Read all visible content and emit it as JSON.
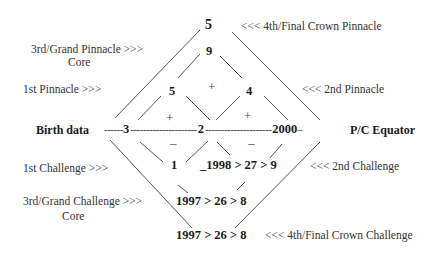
{
  "diagram": {
    "top_number": "5",
    "crown_pinnacle_label": "<<<  4th/Final Crown Pinnacle",
    "grand_pinnacle_label": "3rd/Grand Pinnacle  >>>",
    "grand_pinnacle_core": "Core",
    "grand_pinnacle_value": "9",
    "first_pinnacle_label": "1st Pinnacle  >>>",
    "first_pinnacle_value": "5",
    "center_plus": "+",
    "second_pinnacle_value": "4",
    "second_pinnacle_label": "<<<  2nd Pinnacle",
    "left_plus": "+",
    "right_plus": "+",
    "equator": {
      "left_label": "Birth data",
      "left_dashes": "------",
      "left_value": "3",
      "mid_dashes_1": "---------------------",
      "center_value": "2",
      "mid_dashes_2": "---------------------",
      "right_value": "2000",
      "right_dash": " –",
      "right_label": "P/C Equator"
    },
    "left_minus": "–",
    "right_minus": "–",
    "first_challenge_label": "1st Challenge  >>>",
    "first_challenge_value": "1",
    "second_challenge_value": "_1998 > 27 > 9",
    "second_challenge_label": "<<<  2nd Challenge",
    "grand_challenge_label": "3rd/Grand Challenge  >>>",
    "grand_challenge_core": "Core",
    "grand_challenge_value": "1997 > 26 > 8",
    "crown_challenge_value": "1997 > 26 > 8",
    "crown_challenge_label": "<<<  4th/Final Crown Challenge"
  }
}
